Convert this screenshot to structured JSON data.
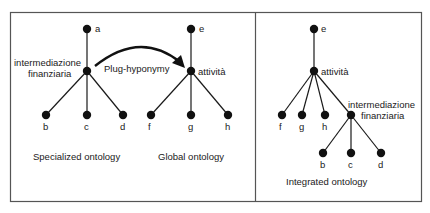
{
  "panels": {
    "specialized": {
      "caption": "Specialized ontology",
      "root": "a",
      "concept_line1": "intermediazione",
      "concept_line2": "finanziaria",
      "children": [
        "b",
        "c",
        "d"
      ]
    },
    "global": {
      "caption": "Global ontology",
      "root": "e",
      "concept": "attività",
      "children": [
        "f",
        "g",
        "h"
      ]
    },
    "integrated": {
      "caption": "Integrated ontology",
      "root": "e",
      "concept": "attività",
      "children": [
        "f",
        "g",
        "h"
      ],
      "sub_concept_line1": "intermediazione",
      "sub_concept_line2": "finanziaria",
      "sub_children": [
        "b",
        "c",
        "d"
      ]
    }
  },
  "arrow": {
    "label": "Plug-hyponymy"
  },
  "colors": {
    "line": "#1a1a1a",
    "border": "#555555",
    "background": "#ffffff"
  }
}
